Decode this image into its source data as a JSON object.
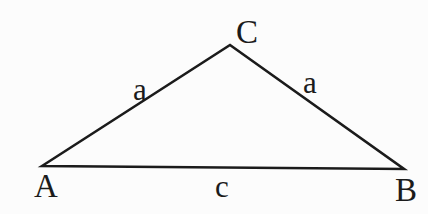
{
  "figure": {
    "background_color": "#fcfcfc",
    "stroke_color": "#1b1b1b",
    "triangle_points": "42,166 230,45 404,169",
    "labels": {
      "vertex_A": "A",
      "vertex_B": "B",
      "vertex_C": "C",
      "side_left": "a",
      "side_right": "a",
      "side_base": "c"
    }
  }
}
